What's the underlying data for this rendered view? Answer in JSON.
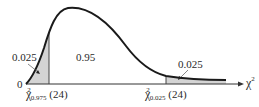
{
  "diagram": {
    "type": "chi-square-distribution",
    "degrees_of_freedom": "24",
    "origin_label": "0",
    "x_axis_label": {
      "symbol": "χ",
      "superscript": "2"
    },
    "regions": [
      {
        "name": "left-tail",
        "area_label": "0.025",
        "shaded": true
      },
      {
        "name": "center",
        "area_label": "0.95",
        "shaded": false
      },
      {
        "name": "right-tail",
        "area_label": "0.025",
        "shaded": true
      }
    ],
    "critical_values": [
      {
        "symbol": "χ",
        "superscript": "2",
        "subscript": "0.975",
        "df": "(24)"
      },
      {
        "symbol": "χ",
        "superscript": "2",
        "subscript": "0.025",
        "df": "(24)"
      }
    ],
    "colors": {
      "curve": "#1a1a1a",
      "shade": "#d4d4d4",
      "axis": "#333333"
    }
  }
}
